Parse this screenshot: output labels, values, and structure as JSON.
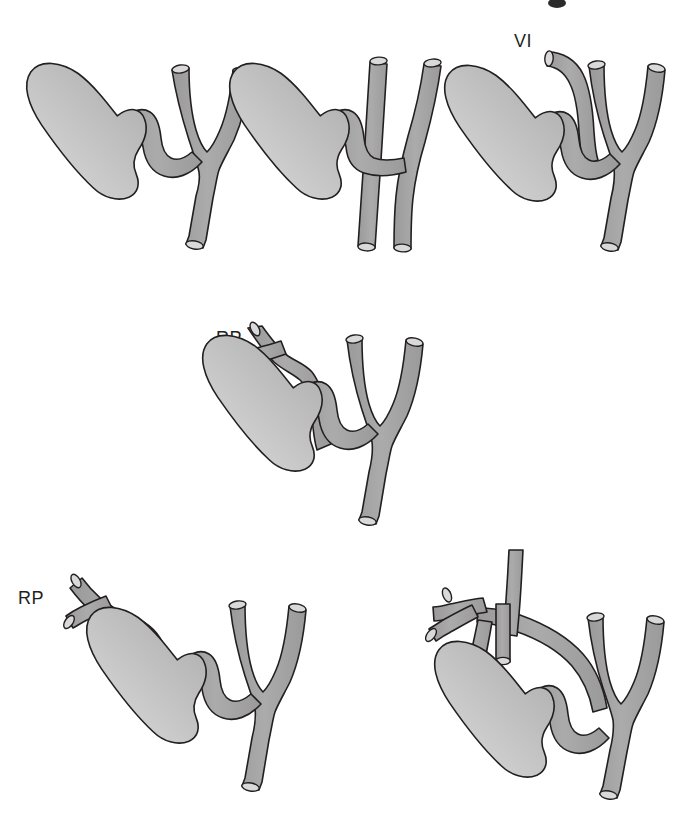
{
  "figure": {
    "background_color": "#ffffff",
    "outline_color": "#231f20",
    "duct_fill": "#a3a3a3",
    "duct_fill_light": "#b6b6b6",
    "gallbladder_fill_dark": "#b0b0b0",
    "gallbladder_fill_light": "#d6d6d6",
    "cap_fill": "#d9d9d9",
    "panel_count": 6
  },
  "panels": [
    {
      "id": "panel-1",
      "position": "top-left",
      "label": "",
      "has_label": false,
      "description": "Gallbladder with short cystic duct joining common hepatic duct below the confluence of right and left hepatic ducts"
    },
    {
      "id": "panel-2",
      "position": "top-middle",
      "label": "",
      "has_label": false,
      "description": "Low parallel cystic duct running alongside the common hepatic duct with low medial insertion"
    },
    {
      "id": "panel-3",
      "position": "top-right",
      "label": "VI",
      "has_label": true,
      "description": "Aberrant segment VI duct draining into the cystic duct near the gallbladder neck"
    },
    {
      "id": "panel-4",
      "position": "middle-center",
      "label": "RP",
      "has_label": true,
      "description": "Right posterior sectoral duct joining the cystic duct, arching above the gallbladder neck"
    },
    {
      "id": "panel-5",
      "position": "bottom-left",
      "label": "RP",
      "has_label": true,
      "description": "Right posterior sectoral duct draining directly into the gallbladder infundibulum via a long arching course"
    },
    {
      "id": "panel-6",
      "position": "bottom-right",
      "label": "",
      "has_label": false,
      "description": "Complex variant with crossing accessory ducts over the gallbladder and an additional short stub duct"
    }
  ],
  "labels": {
    "vi": "VI",
    "rp_middle": "RP",
    "rp_bottom": "RP"
  }
}
